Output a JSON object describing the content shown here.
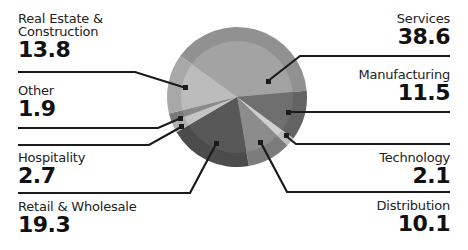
{
  "chart_data": {
    "type": "pie",
    "title": "",
    "unit": "%",
    "categories": [
      "Services",
      "Manufacturing",
      "Technology",
      "Distribution",
      "Retail & Wholesale",
      "Hospitality",
      "Other",
      "Real Estate & Construction"
    ],
    "values": [
      38.6,
      11.5,
      2.1,
      10.1,
      19.3,
      2.7,
      1.9,
      13.8
    ],
    "colors": [
      "#a3a3a3",
      "#6f6f6f",
      "#cfcfcf",
      "#8c8c8c",
      "#585858",
      "#c4c4c4",
      "#8a8a8a",
      "#bcbcbc"
    ],
    "ring_colors": [
      "#919191",
      "#636363",
      "#bdbdbd",
      "#7c7c7c",
      "#4c4c4c",
      "#b0b0b0",
      "#7a7a7a",
      "#a8a8a8"
    ],
    "start_angle_deg": -144,
    "legend": "callout labels with leader lines"
  },
  "labels": {
    "real_estate": {
      "name": "Real Estate &",
      "name2": "Construction",
      "value": "13.8"
    },
    "other": {
      "name": "Other",
      "value": "1.9"
    },
    "hospitality": {
      "name": "Hospitality",
      "value": "2.7"
    },
    "retail": {
      "name": "Retail & Wholesale",
      "value": "19.3"
    },
    "services": {
      "name": "Services",
      "value": "38.6"
    },
    "manufacturing": {
      "name": "Manufacturing",
      "value": "11.5"
    },
    "technology": {
      "name": "Technology",
      "value": "2.1"
    },
    "distribution": {
      "name": "Distribution",
      "value": "10.1"
    }
  }
}
